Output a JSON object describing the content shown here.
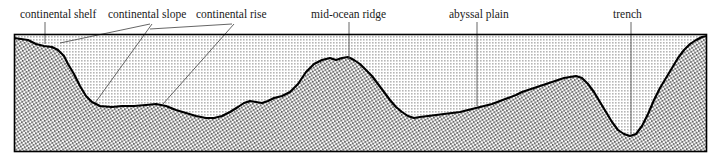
{
  "figure": {
    "frame": {
      "x": 14,
      "y": 34,
      "width": 693,
      "height": 118
    },
    "colors": {
      "water": "#d9d9d9",
      "crust_stipple": "#f2f2f2",
      "profile_line": "#000000",
      "leader_line": "#555555",
      "frame_line": "#000000",
      "label_text": "#1a1a1a",
      "background": "#ffffff"
    },
    "sealevel_y": 34,
    "basin_floor_y": 152
  },
  "labels": [
    {
      "id": "continental-shelf",
      "text": "continental shelf",
      "x": 20,
      "y": 9
    },
    {
      "id": "continental-slope",
      "text": "continental slope",
      "x": 108,
      "y": 9
    },
    {
      "id": "continental-rise",
      "text": "continental rise",
      "x": 196,
      "y": 9
    },
    {
      "id": "mid-ocean-ridge",
      "text": "mid-ocean ridge",
      "x": 311,
      "y": 9
    },
    {
      "id": "abyssal-plain",
      "text": "abyssal plain",
      "x": 449,
      "y": 9
    },
    {
      "id": "trench",
      "text": "trench",
      "x": 613,
      "y": 9
    }
  ],
  "leaders": [
    {
      "id": "leader-continental-shelf",
      "points": "45,22 45,44"
    },
    {
      "id": "leader-continental-slope-a",
      "points": "150,24 60,43"
    },
    {
      "id": "leader-continental-slope-b",
      "points": "152,24 95,103"
    },
    {
      "id": "leader-continental-rise-a",
      "points": "232,24 150,29"
    },
    {
      "id": "leader-continental-rise-b",
      "points": "234,24 163,104"
    },
    {
      "id": "leader-mid-ocean-ridge",
      "points": "349,22 349,60"
    },
    {
      "id": "leader-abyssal-plain",
      "points": "477,22 477,106"
    },
    {
      "id": "leader-trench",
      "points": "631,22 631,135"
    }
  ],
  "features": {
    "seafloor_profile": "14,38 28,40 36,44 44,46 52,47 58,50 64,56 68,64 74,74 80,86 86,96 92,102 100,106 112,107 122,106 134,106 146,105 156,104 166,106 176,110 186,113 196,116 206,118 214,118 222,116 230,112 238,107 244,103 250,101 256,102 262,103 268,101 274,98 282,96 290,92 298,84 306,72 314,64 322,60 330,58 336,60 342,58 348,57 354,60 360,64 366,70 372,76 378,84 384,92 390,100 396,107 402,112 408,116 414,118 420,117 428,116 436,115 444,114 452,113 460,112 468,110 476,108 484,106 492,104 500,101 508,98 516,95 522,92 528,90 534,88 540,86 546,84 552,82 558,80 564,78 570,77 576,76 582,78 588,84 594,92 600,102 606,112 612,122 618,130 624,134 630,136 636,134 642,126 648,114 654,100 660,88 666,78 672,68 678,58 684,50 690,44 696,40 702,37 707,36",
    "land_left": "14,34 14,152 100,152 100,106 92,102 86,96 80,86 74,74 68,64 64,56 58,50 52,47 44,46 36,44 28,40 14,38",
    "description": "Schematic bathymetric profile showing continental margin, abyssal plain, mid-ocean ridge and trench"
  }
}
